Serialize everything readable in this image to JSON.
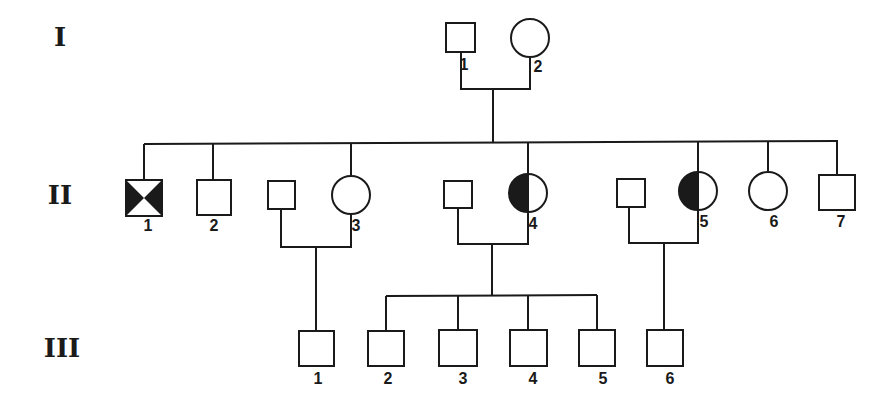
{
  "diagram": {
    "type": "pedigree",
    "colors": {
      "ink": "#1a1a1a",
      "background": "#ffffff"
    },
    "generations": [
      {
        "label": "I",
        "x": 60,
        "y": 46
      },
      {
        "label": "II",
        "x": 60,
        "y": 204
      },
      {
        "label": "III",
        "x": 62,
        "y": 357
      }
    ],
    "individuals": [
      {
        "id": "I-1",
        "label": "1",
        "sex": "male",
        "status": "unaffected",
        "x": 446,
        "y": 23,
        "w": 29,
        "h": 29,
        "lx": 464,
        "ly": 70
      },
      {
        "id": "I-2",
        "label": "2",
        "sex": "female",
        "status": "unaffected",
        "cx": 530,
        "cy": 38,
        "r": 19,
        "lx": 538,
        "ly": 72
      },
      {
        "id": "II-1",
        "label": "1",
        "sex": "male",
        "status": "affected-deceased-pattern",
        "x": 126,
        "y": 180,
        "w": 36,
        "h": 36,
        "lx": 148,
        "ly": 231
      },
      {
        "id": "II-2",
        "label": "2",
        "sex": "male",
        "status": "unaffected",
        "x": 197,
        "y": 180,
        "w": 34,
        "h": 35,
        "lx": 214,
        "ly": 231
      },
      {
        "id": "II-3-spouse",
        "label": "",
        "sex": "male",
        "status": "unaffected",
        "x": 268,
        "y": 181,
        "w": 27,
        "h": 28
      },
      {
        "id": "II-3",
        "label": "3",
        "sex": "female",
        "status": "unaffected",
        "cx": 351,
        "cy": 195,
        "r": 19,
        "lx": 356,
        "ly": 231
      },
      {
        "id": "II-4-spouse",
        "label": "",
        "sex": "male",
        "status": "unaffected",
        "x": 444,
        "y": 181,
        "w": 28,
        "h": 27
      },
      {
        "id": "II-4",
        "label": "4",
        "sex": "female",
        "status": "carrier-half-filled",
        "cx": 528,
        "cy": 193,
        "r": 19,
        "lx": 533,
        "ly": 229
      },
      {
        "id": "II-5-spouse",
        "label": "",
        "sex": "male",
        "status": "unaffected",
        "x": 617,
        "y": 179,
        "w": 28,
        "h": 28
      },
      {
        "id": "II-5",
        "label": "5",
        "sex": "female",
        "status": "carrier-half-filled",
        "cx": 698,
        "cy": 191,
        "r": 19,
        "lx": 704,
        "ly": 227
      },
      {
        "id": "II-6",
        "label": "6",
        "sex": "female",
        "status": "unaffected",
        "cx": 768,
        "cy": 191,
        "r": 19,
        "lx": 774,
        "ly": 227
      },
      {
        "id": "II-7",
        "label": "7",
        "sex": "male",
        "status": "unaffected",
        "x": 819,
        "y": 175,
        "w": 36,
        "h": 35,
        "lx": 841,
        "ly": 227
      },
      {
        "id": "III-1",
        "label": "1",
        "sex": "male",
        "status": "unaffected",
        "x": 299,
        "y": 331,
        "w": 35,
        "h": 35,
        "lx": 318,
        "ly": 384
      },
      {
        "id": "III-2",
        "label": "2",
        "sex": "male",
        "status": "affected",
        "x": 368,
        "y": 331,
        "w": 36,
        "h": 35,
        "lx": 388,
        "ly": 384
      },
      {
        "id": "III-3",
        "label": "3",
        "sex": "male",
        "status": "unaffected",
        "x": 439,
        "y": 330,
        "w": 38,
        "h": 36,
        "lx": 463,
        "ly": 384
      },
      {
        "id": "III-4",
        "label": "4",
        "sex": "male",
        "status": "affected",
        "x": 510,
        "y": 330,
        "w": 37,
        "h": 36,
        "lx": 533,
        "ly": 384
      },
      {
        "id": "III-5",
        "label": "5",
        "sex": "male",
        "status": "unaffected",
        "x": 579,
        "y": 330,
        "w": 36,
        "h": 36,
        "lx": 603,
        "ly": 384
      },
      {
        "id": "III-6",
        "label": "6",
        "sex": "male",
        "status": "affected",
        "x": 647,
        "y": 330,
        "w": 36,
        "h": 36,
        "lx": 670,
        "ly": 384
      }
    ],
    "lines": [
      {
        "name": "I-mating-left",
        "points": [
          [
            461,
            52
          ],
          [
            461,
            89
          ]
        ]
      },
      {
        "name": "I-mating-right",
        "points": [
          [
            530,
            57
          ],
          [
            530,
            89
          ]
        ]
      },
      {
        "name": "I-mating-line",
        "points": [
          [
            460,
            89
          ],
          [
            531,
            89
          ]
        ]
      },
      {
        "name": "I-descent",
        "points": [
          [
            493,
            89
          ],
          [
            493,
            143
          ]
        ]
      },
      {
        "name": "II-sibship-line",
        "points": [
          [
            144,
            144
          ],
          [
            838,
            141
          ]
        ]
      },
      {
        "name": "II-1-drop",
        "points": [
          [
            144,
            144
          ],
          [
            144,
            180
          ]
        ]
      },
      {
        "name": "II-2-drop",
        "points": [
          [
            213,
            144
          ],
          [
            213,
            180
          ]
        ]
      },
      {
        "name": "II-3-drop",
        "points": [
          [
            351,
            143
          ],
          [
            351,
            176
          ]
        ]
      },
      {
        "name": "II-4-drop",
        "points": [
          [
            528,
            142
          ],
          [
            528,
            174
          ]
        ]
      },
      {
        "name": "II-5-drop",
        "points": [
          [
            698,
            142
          ],
          [
            698,
            172
          ]
        ]
      },
      {
        "name": "II-6-drop",
        "points": [
          [
            768,
            141
          ],
          [
            768,
            172
          ]
        ]
      },
      {
        "name": "II-7-drop",
        "points": [
          [
            837,
            141
          ],
          [
            837,
            175
          ]
        ]
      },
      {
        "name": "II-3-mating",
        "points": [
          [
            281,
            209
          ],
          [
            281,
            247
          ],
          [
            351,
            247
          ],
          [
            351,
            214
          ]
        ]
      },
      {
        "name": "II-3-descent",
        "points": [
          [
            316,
            247
          ],
          [
            316,
            331
          ]
        ]
      },
      {
        "name": "II-4-mating",
        "points": [
          [
            458,
            208
          ],
          [
            458,
            244
          ],
          [
            528,
            244
          ],
          [
            528,
            212
          ]
        ]
      },
      {
        "name": "II-4-descent",
        "points": [
          [
            492,
            244
          ],
          [
            492,
            296
          ]
        ]
      },
      {
        "name": "III-sibship-line",
        "points": [
          [
            386,
            296
          ],
          [
            597,
            295
          ]
        ]
      },
      {
        "name": "III-2-drop",
        "points": [
          [
            386,
            296
          ],
          [
            386,
            331
          ]
        ]
      },
      {
        "name": "III-3-drop",
        "points": [
          [
            458,
            296
          ],
          [
            458,
            330
          ]
        ]
      },
      {
        "name": "III-4-drop",
        "points": [
          [
            528,
            295
          ],
          [
            528,
            330
          ]
        ]
      },
      {
        "name": "III-5-drop",
        "points": [
          [
            597,
            295
          ],
          [
            597,
            330
          ]
        ]
      },
      {
        "name": "II-5-mating",
        "points": [
          [
            629,
            207
          ],
          [
            629,
            243
          ],
          [
            698,
            243
          ],
          [
            698,
            210
          ]
        ]
      },
      {
        "name": "II-5-descent",
        "points": [
          [
            664,
            243
          ],
          [
            664,
            330
          ]
        ]
      }
    ]
  }
}
